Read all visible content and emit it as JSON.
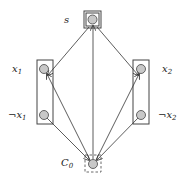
{
  "diagram": {
    "nodes": {
      "s": {
        "label": "s"
      },
      "x1": {
        "label": "x",
        "sub": "1"
      },
      "notx1": {
        "label": "¬x",
        "sub": "1"
      },
      "x2": {
        "label": "x",
        "sub": "2"
      },
      "notx2": {
        "label": "¬x",
        "sub": "2"
      },
      "c0": {
        "label": "C",
        "sub": "0"
      }
    },
    "edges": [
      {
        "from": "s",
        "to": "x1"
      },
      {
        "from": "s",
        "to": "x2"
      },
      {
        "from": "c0",
        "to": "s"
      },
      {
        "from": "c0",
        "to": "x1"
      },
      {
        "from": "c0",
        "to": "x2"
      },
      {
        "from": "notx1",
        "to": "c0"
      },
      {
        "from": "notx2",
        "to": "c0"
      }
    ],
    "colors": {
      "node_fill": "#c8c8c8",
      "stroke": "#333333"
    }
  }
}
